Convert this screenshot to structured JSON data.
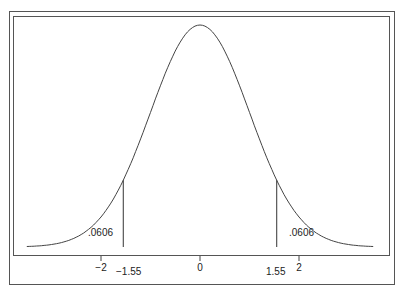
{
  "chart_data": {
    "type": "line",
    "title": "",
    "xlabel": "",
    "ylabel": "",
    "xlim": [
      -3.5,
      3.5
    ],
    "x_ticks": [
      -2,
      0,
      2
    ],
    "x_tick_labels": [
      "−2",
      "0",
      "2"
    ],
    "critical_values": [
      -1.55,
      1.55
    ],
    "critical_labels": [
      "−1.55",
      "1.55"
    ],
    "tail_areas": [
      {
        "side": "left",
        "label": ".0606",
        "value": 0.0606
      },
      {
        "side": "right",
        "label": ".0606",
        "value": 0.0606
      }
    ],
    "series": [
      {
        "name": "Standard normal density",
        "mean": 0,
        "sd": 1
      }
    ],
    "grid": false,
    "legend": null,
    "colors": {
      "curve": "#444444",
      "frame": "#555555"
    }
  }
}
